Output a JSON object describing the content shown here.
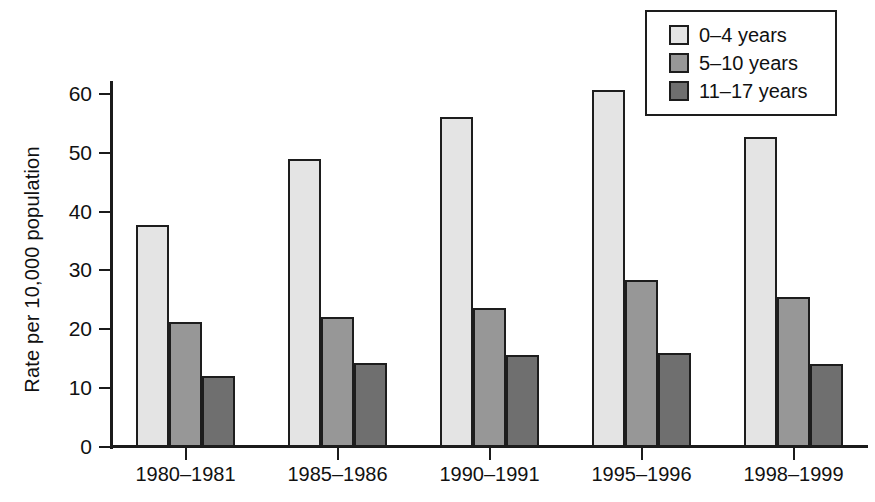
{
  "chart_data": {
    "type": "bar",
    "title": "",
    "subtitle": "",
    "xlabel": "",
    "ylabel": "Rate per 10,000 population",
    "categories": [
      "1980–1981",
      "1985–1986",
      "1990–1991",
      "1995–1996",
      "1998–1999"
    ],
    "series": [
      {
        "name": "0–4 years",
        "color": "#e4e4e4",
        "values": [
          37.7,
          49.0,
          56.1,
          60.6,
          52.7
        ]
      },
      {
        "name": "5–10 years",
        "color": "#979797",
        "values": [
          21.3,
          22.1,
          23.6,
          28.4,
          25.4
        ]
      },
      {
        "name": "11–17 years",
        "color": "#6f6f6f",
        "values": [
          12.0,
          14.3,
          15.7,
          16.0,
          14.1
        ]
      }
    ],
    "ylim": [
      0,
      62
    ],
    "yticks": [
      0,
      10,
      20,
      30,
      40,
      50,
      60
    ],
    "ytick_labels": [
      "0",
      "10",
      "20",
      "30",
      "40",
      "50",
      "60"
    ],
    "grid": false,
    "legend_position": "top-right"
  },
  "legend": {
    "items": [
      {
        "label": "0–4 years"
      },
      {
        "label": "5–10 years"
      },
      {
        "label": "11–17 years"
      }
    ]
  }
}
